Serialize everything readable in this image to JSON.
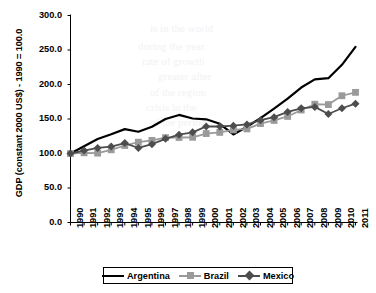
{
  "chart_data": {
    "type": "line",
    "title": "",
    "xlabel": "",
    "ylabel": "GDP (constant 2000 US$) - 1990 = 100.0",
    "ylim": [
      0,
      300
    ],
    "yticks": [
      "0.0",
      "50.0",
      "100.0",
      "150.0",
      "200.0",
      "250.0",
      "300.0"
    ],
    "grid": false,
    "legend_position": "bottom",
    "categories": [
      "1990",
      "1991",
      "1992",
      "1993",
      "1994",
      "1995",
      "1996",
      "1997",
      "1998",
      "1999",
      "2000",
      "2001",
      "2002",
      "2003",
      "2004",
      "2005",
      "2006",
      "2007",
      "2008",
      "2009",
      "2010",
      "2011"
    ],
    "series": [
      {
        "name": "Argentina",
        "color": "#000000",
        "marker": "none",
        "values": [
          100.0,
          110.6,
          121.0,
          127.9,
          135.3,
          131.5,
          138.7,
          150.0,
          155.9,
          150.7,
          149.6,
          143.0,
          127.6,
          138.8,
          151.3,
          165.1,
          179.4,
          195.6,
          207.4,
          209.1,
          228.5,
          254.6
        ]
      },
      {
        "name": "Brazil",
        "color": "#9a9a9a",
        "marker": "square",
        "values": [
          100.0,
          101.0,
          100.5,
          105.4,
          111.6,
          116.4,
          119.0,
          123.0,
          123.2,
          123.5,
          128.9,
          130.6,
          134.1,
          135.6,
          143.4,
          147.9,
          153.7,
          163.0,
          171.4,
          170.9,
          183.7,
          188.6
        ]
      },
      {
        "name": "Mexico",
        "color": "#4d4d4d",
        "marker": "diamond",
        "values": [
          100.0,
          104.2,
          108.0,
          110.1,
          115.1,
          108.0,
          113.5,
          121.3,
          127.3,
          130.7,
          139.3,
          139.1,
          140.3,
          142.2,
          148.2,
          152.6,
          160.2,
          165.5,
          167.5,
          157.2,
          165.6,
          172.2
        ]
      }
    ]
  },
  "legend": {
    "items": [
      {
        "label": "Argentina"
      },
      {
        "label": "Brazil"
      },
      {
        "label": "Mexico"
      }
    ]
  },
  "watermarks": [
    {
      "text": "is in the world",
      "x": 150,
      "y": 22
    },
    {
      "text": "during the year",
      "x": 138,
      "y": 40
    },
    {
      "text": "rate of growth",
      "x": 142,
      "y": 55
    },
    {
      "text": "greater after",
      "x": 158,
      "y": 70
    },
    {
      "text": "of the region",
      "x": 150,
      "y": 86
    },
    {
      "text": "crisis in the",
      "x": 146,
      "y": 101
    },
    {
      "text": "of the period",
      "x": 150,
      "y": 116
    }
  ]
}
